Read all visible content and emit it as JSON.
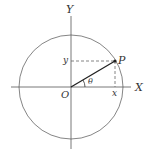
{
  "diagram": {
    "labels": {
      "y_axis": "Y",
      "x_axis": "X",
      "origin": "O",
      "point": "P",
      "angle": "θ",
      "x_proj": "x",
      "y_proj": "y"
    },
    "colors": {
      "stroke": "#555555",
      "radius": "#222222",
      "dashed": "#666666",
      "text": "#333333"
    }
  }
}
